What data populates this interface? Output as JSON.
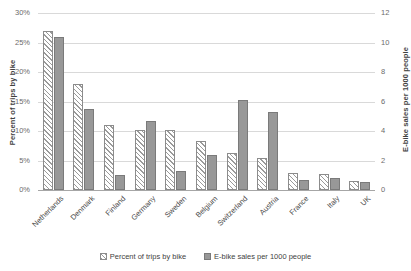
{
  "chart_data": {
    "type": "bar",
    "title": "",
    "subtitle": "",
    "xlabel": "",
    "ylabel": "Percent of trips by bike",
    "y2label": "E-bike sales per 1000 people",
    "ylim": [
      0,
      30
    ],
    "y2lim": [
      0,
      12
    ],
    "grid": true,
    "legend_position": "bottom-center",
    "categories": [
      "Netherlands",
      "Denmark",
      "Finland",
      "Germany",
      "Sweden",
      "Belgium",
      "Switzerland",
      "Austria",
      "France",
      "Italy",
      "UK"
    ],
    "series": [
      {
        "name": "Percent of trips by bike",
        "axis": "left",
        "style": "hatched",
        "color": "#9a9a9a",
        "unit": "%",
        "values": [
          27.0,
          18.0,
          11.0,
          10.2,
          10.2,
          8.3,
          6.3,
          5.5,
          2.8,
          2.7,
          1.6
        ]
      },
      {
        "name": "E-bike sales per 1000 people",
        "axis": "right",
        "style": "solid",
        "color": "#989898",
        "unit": "",
        "values": [
          10.4,
          5.5,
          1.0,
          4.7,
          1.3,
          2.35,
          6.1,
          5.3,
          0.65,
          0.8,
          0.55
        ]
      }
    ],
    "left_axis_ticks": [
      "0%",
      "5%",
      "10%",
      "15%",
      "20%",
      "25%",
      "30%"
    ],
    "left_axis_tick_values": [
      0,
      5,
      10,
      15,
      20,
      25,
      30
    ],
    "right_axis_ticks": [
      "0",
      "2",
      "4",
      "6",
      "8",
      "10",
      "12"
    ],
    "right_axis_tick_values": [
      0,
      2,
      4,
      6,
      8,
      10,
      12
    ]
  },
  "legend": {
    "items": [
      {
        "label": "Percent of trips by bike",
        "style": "hatch"
      },
      {
        "label": "E-bike sales per 1000 people",
        "style": "solid"
      }
    ]
  },
  "colors": {
    "gridline": "#d9d9d9",
    "axis": "#a6a6a6",
    "text": "#3f3f3f",
    "tick_text": "#6b6b6b",
    "bar_hatch_line": "#9a9a9a",
    "bar_solid_fill": "#989898",
    "background": "#ffffff"
  }
}
